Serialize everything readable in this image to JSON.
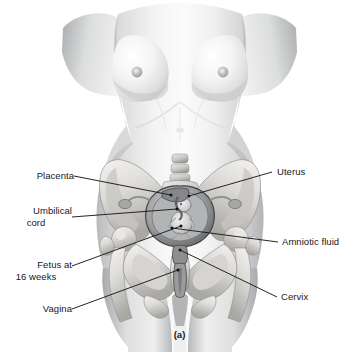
{
  "figure": {
    "caption": "(a)",
    "background_color": "#ffffff",
    "text_color": "#17181a",
    "leader_line_color": "#1a1a1a"
  },
  "labels": {
    "left": [
      {
        "name": "placenta",
        "lines": [
          "Placenta"
        ],
        "x": 18,
        "y": 170
      },
      {
        "name": "umbilical-cord",
        "lines": [
          "Umbilical",
          "cord"
        ],
        "x": 9,
        "y": 205
      },
      {
        "name": "fetus",
        "lines": [
          "Fetus at",
          "16 weeks"
        ],
        "x": 13,
        "y": 259
      },
      {
        "name": "vagina",
        "lines": [
          "Vagina"
        ],
        "x": 26,
        "y": 303
      }
    ],
    "right": [
      {
        "name": "uterus",
        "lines": [
          "Uterus"
        ],
        "x": 277,
        "y": 166
      },
      {
        "name": "amniotic-fluid",
        "lines": [
          "Amniotic fluid"
        ],
        "x": 282,
        "y": 236
      },
      {
        "name": "cervix",
        "lines": [
          "Cervix"
        ],
        "x": 281,
        "y": 291
      }
    ]
  },
  "anatomy_parts": [
    "breast-left",
    "breast-right",
    "nipple-left",
    "nipple-right",
    "abdomen",
    "iliac-crest-left",
    "iliac-crest-right",
    "sacrum",
    "lumbar-vertebrae",
    "femur-head-left",
    "femur-head-right",
    "pubic-symphysis",
    "ischium-left",
    "ischium-right",
    "uterus-wall",
    "fetus",
    "placenta",
    "umbilical-cord",
    "amniotic-cavity",
    "cervix",
    "vagina",
    "ovary-left",
    "ovary-right",
    "fallopian-tube-left",
    "fallopian-tube-right",
    "thigh-left",
    "thigh-right"
  ]
}
